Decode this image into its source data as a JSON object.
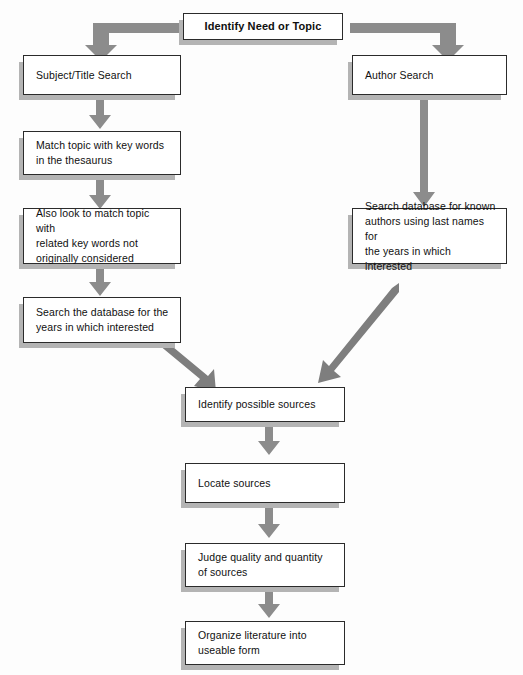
{
  "diagram": {
    "title": "Identify Need or Topic",
    "type": "flowchart",
    "background_color": "#fdfdfd",
    "box_fill_color": "#ffffff",
    "box_border_color": "#2b2b2b",
    "box_shadow_color": "#b4b4b4",
    "arrow_color": "#8c8c8c"
  },
  "nodes": {
    "start": {
      "label": "Identify Need or Topic"
    },
    "subject_search": {
      "label": "Subject/Title Search"
    },
    "match_thesaurus": {
      "label": "Match topic with key words\nin the thesaurus"
    },
    "related_keywords": {
      "label": "Also look to match topic with\nrelated key words not\noriginally considered"
    },
    "search_years_left": {
      "label": "Search the database for the\nyears in which interested"
    },
    "author_search": {
      "label": "Author Search"
    },
    "search_authors_right": {
      "label": "Search database for known\nauthors using last names for\nthe years in which interested"
    },
    "identify_sources": {
      "label": "Identify possible sources"
    },
    "locate_sources": {
      "label": "Locate sources"
    },
    "judge_sources": {
      "label": "Judge quality and quantity\nof sources"
    },
    "organize_literature": {
      "label": "Organize literature into\nuseable form"
    }
  },
  "connectors": [
    {
      "name": "start-to-subject-search",
      "kind": "elbow-left-down"
    },
    {
      "name": "start-to-author-search",
      "kind": "elbow-right-down"
    },
    {
      "name": "subject-search-to-match-thesaurus",
      "kind": "down"
    },
    {
      "name": "match-thesaurus-to-related-keywords",
      "kind": "down"
    },
    {
      "name": "related-keywords-to-search-years",
      "kind": "down"
    },
    {
      "name": "author-search-to-search-authors",
      "kind": "down-long"
    },
    {
      "name": "search-years-to-identify-sources",
      "kind": "diagonal-down-right"
    },
    {
      "name": "search-authors-to-identify-sources",
      "kind": "diagonal-down-left"
    },
    {
      "name": "identify-sources-to-locate-sources",
      "kind": "down"
    },
    {
      "name": "locate-sources-to-judge-sources",
      "kind": "down"
    },
    {
      "name": "judge-sources-to-organize-literature",
      "kind": "down"
    }
  ]
}
